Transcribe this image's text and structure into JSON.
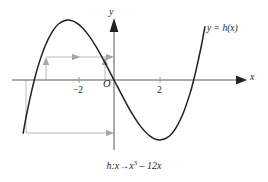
{
  "figure": {
    "caption": "h:x →x³ – 12x",
    "caption_parts": {
      "fn": "h",
      "colon_var": ":x",
      "arrow": "→",
      "term_base": "x",
      "term_exp": "3",
      "minus": "– 12x"
    },
    "curve_label": "y = h(x)",
    "axis_x_label": "x",
    "axis_y_label": "y",
    "origin_label": "O",
    "ticks_x": [
      "−2",
      "2"
    ],
    "colors": {
      "curve": "#231f20",
      "axis": "#58595b",
      "auxiliary": "#b3b3b3",
      "background": "#ffffff"
    }
  },
  "chart_data": {
    "type": "line",
    "title": "",
    "subtitle": "",
    "function": "h(x) = x^3 - 12x",
    "xlabel": "x",
    "ylabel": "y",
    "xlim": [
      -4.3,
      4.4
    ],
    "ylim": [
      -20,
      22
    ],
    "grid": false,
    "legend_position": "upper-right",
    "legend_entries": [
      "y = h(x)"
    ],
    "xticks": [
      -2,
      2
    ],
    "xtick_labels": [
      "−2",
      "2"
    ],
    "yticks": [],
    "ytick_labels": [],
    "annotations": [
      "h:x →x³ – 12x",
      "O"
    ],
    "key_points": {
      "local_maximum": [
        -2,
        16
      ],
      "local_minimum": [
        2,
        -16
      ],
      "roots": [
        -3.464,
        0,
        3.464
      ],
      "inflection": [
        0,
        0
      ]
    },
    "series": [
      {
        "name": "y = h(x)",
        "x": [
          -3.95,
          -3.8,
          -3.6,
          -3.464,
          -3.3,
          -3.0,
          -2.7,
          -2.4,
          -2.0,
          -1.6,
          -1.2,
          -0.8,
          -0.4,
          0,
          0.4,
          0.8,
          1.2,
          1.6,
          2.0,
          2.4,
          2.7,
          3.0,
          3.3,
          3.464,
          3.6,
          3.8,
          3.95
        ],
        "y": [
          -14.2,
          -9.2,
          -3.5,
          0,
          3.7,
          9.0,
          12.7,
          15.0,
          16.0,
          15.1,
          12.7,
          9.1,
          4.7,
          0,
          -4.7,
          -9.1,
          -12.7,
          -15.1,
          -16.0,
          -15.0,
          -12.7,
          -9.0,
          -3.7,
          0,
          3.5,
          9.2,
          14.2
        ]
      }
    ],
    "auxiliary_construction": [
      {
        "name": "upper-horizontal-arrow",
        "from": [
          -3.0,
          16.0
        ],
        "to": [
          0,
          16.0
        ],
        "style": "gray-arrow"
      },
      {
        "name": "left-vertical-arrow",
        "from": [
          -3.0,
          0
        ],
        "to": [
          -3.0,
          16.0
        ],
        "style": "gray-arrow"
      },
      {
        "name": "right-vertical-arrow",
        "from": [
          -0.4,
          0
        ],
        "to": [
          -0.4,
          16.0
        ],
        "style": "gray-arrow"
      },
      {
        "name": "lower-horizontal-arrow",
        "from": [
          -3.85,
          -16.0
        ],
        "to": [
          0,
          -16.0
        ],
        "style": "gray-arrow"
      },
      {
        "name": "left-drop-vertical",
        "from": [
          -3.85,
          0
        ],
        "to": [
          -3.85,
          -16.0
        ],
        "style": "gray-line"
      }
    ]
  }
}
